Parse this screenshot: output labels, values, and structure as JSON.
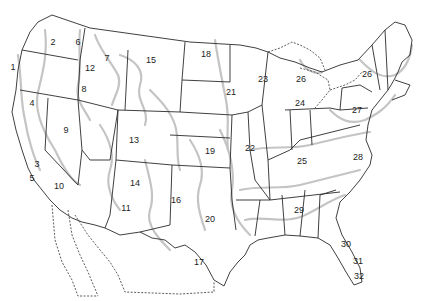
{
  "map": {
    "title": "",
    "colors": {
      "state_lines": "#2a2a2a",
      "contour_lines": "#c4c4c4",
      "background": "#ffffff"
    },
    "regions": [
      {
        "label": "1",
        "x": 13,
        "y": 67
      },
      {
        "label": "2",
        "x": 53,
        "y": 42
      },
      {
        "label": "6",
        "x": 78,
        "y": 42
      },
      {
        "label": "7",
        "x": 107,
        "y": 58
      },
      {
        "label": "12",
        "x": 90,
        "y": 68
      },
      {
        "label": "8",
        "x": 84,
        "y": 89
      },
      {
        "label": "4",
        "x": 32,
        "y": 103
      },
      {
        "label": "9",
        "x": 66,
        "y": 130
      },
      {
        "label": "3",
        "x": 37,
        "y": 164
      },
      {
        "label": "5",
        "x": 32,
        "y": 178
      },
      {
        "label": "10",
        "x": 59,
        "y": 186
      },
      {
        "label": "13",
        "x": 134,
        "y": 140
      },
      {
        "label": "14",
        "x": 135,
        "y": 183
      },
      {
        "label": "11",
        "x": 126,
        "y": 208
      },
      {
        "label": "15",
        "x": 151,
        "y": 60
      },
      {
        "label": "18",
        "x": 206,
        "y": 54
      },
      {
        "label": "16",
        "x": 176,
        "y": 200
      },
      {
        "label": "19",
        "x": 210,
        "y": 151
      },
      {
        "label": "20",
        "x": 210,
        "y": 219
      },
      {
        "label": "17",
        "x": 199,
        "y": 262
      },
      {
        "label": "21",
        "x": 231,
        "y": 92
      },
      {
        "label": "22",
        "x": 250,
        "y": 148
      },
      {
        "label": "23",
        "x": 263,
        "y": 79
      },
      {
        "label": "26",
        "x": 301,
        "y": 79
      },
      {
        "label": "24",
        "x": 300,
        "y": 103
      },
      {
        "label": "26",
        "x": 367,
        "y": 74
      },
      {
        "label": "27",
        "x": 357,
        "y": 110
      },
      {
        "label": "25",
        "x": 302,
        "y": 161
      },
      {
        "label": "28",
        "x": 358,
        "y": 157
      },
      {
        "label": "29",
        "x": 299,
        "y": 210
      },
      {
        "label": "30",
        "x": 346,
        "y": 244
      },
      {
        "label": "31",
        "x": 358,
        "y": 261
      },
      {
        "label": "32",
        "x": 359,
        "y": 276
      }
    ]
  }
}
